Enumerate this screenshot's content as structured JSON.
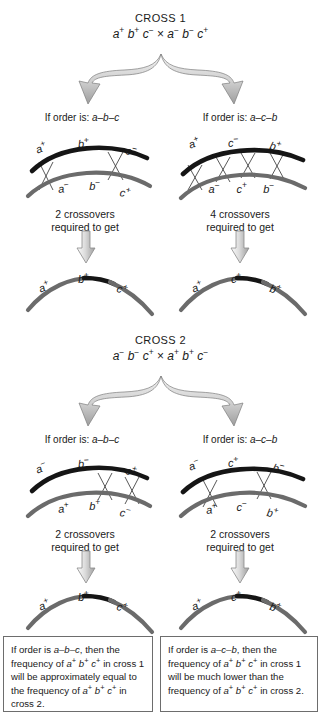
{
  "page": {
    "background": "#ffffff",
    "chromosome_top_color": "#151515",
    "chromosome_bottom_color": "#6b6b6b",
    "arrow_fill_light": "#e4e4e4",
    "arrow_fill_dark": "#9a9a9a",
    "box_border_color": "#6d6d6d",
    "crossover_line_color": "#3a3a3a"
  },
  "cross1": {
    "title": "CROSS 1",
    "genotype": {
      "parent1": [
        {
          "gene": "a",
          "sign": "+"
        },
        {
          "gene": "b",
          "sign": "+"
        },
        {
          "gene": "c",
          "sign": "−"
        }
      ],
      "operator": "×",
      "parent2": [
        {
          "gene": "a",
          "sign": "−"
        },
        {
          "gene": "b",
          "sign": "−"
        },
        {
          "gene": "c",
          "sign": "+"
        }
      ]
    },
    "branches": [
      {
        "order_prefix": "If order is: ",
        "order": "a–b–c",
        "top_chromosome": [
          {
            "gene": "a",
            "sign": "+"
          },
          {
            "gene": "b",
            "sign": "+"
          },
          {
            "gene": "c",
            "sign": "−"
          }
        ],
        "bottom_chromosome": [
          {
            "gene": "a",
            "sign": "−"
          },
          {
            "gene": "b",
            "sign": "−"
          },
          {
            "gene": "c",
            "sign": "+"
          }
        ],
        "crossover_count": 2,
        "crossover_text_line1": "2 crossovers",
        "crossover_text_line2": "required to get",
        "result_chromosome": [
          {
            "gene": "a",
            "sign": "+"
          },
          {
            "gene": "b",
            "sign": "+"
          },
          {
            "gene": "c",
            "sign": "+"
          }
        ]
      },
      {
        "order_prefix": "If order is: ",
        "order": "a–c–b",
        "top_chromosome": [
          {
            "gene": "a",
            "sign": "+"
          },
          {
            "gene": "c",
            "sign": "−"
          },
          {
            "gene": "b",
            "sign": "+"
          }
        ],
        "bottom_chromosome": [
          {
            "gene": "a",
            "sign": "−"
          },
          {
            "gene": "c",
            "sign": "+"
          },
          {
            "gene": "b",
            "sign": "−"
          }
        ],
        "crossover_count": 4,
        "crossover_text_line1": "4 crossovers",
        "crossover_text_line2": "required to get",
        "result_chromosome": [
          {
            "gene": "a",
            "sign": "+"
          },
          {
            "gene": "c",
            "sign": "+"
          },
          {
            "gene": "b",
            "sign": "+"
          }
        ]
      }
    ]
  },
  "cross2": {
    "title": "CROSS 2",
    "genotype": {
      "parent1": [
        {
          "gene": "a",
          "sign": "−"
        },
        {
          "gene": "b",
          "sign": "−"
        },
        {
          "gene": "c",
          "sign": "+"
        }
      ],
      "operator": "×",
      "parent2": [
        {
          "gene": "a",
          "sign": "+"
        },
        {
          "gene": "b",
          "sign": "+"
        },
        {
          "gene": "c",
          "sign": "−"
        }
      ]
    },
    "branches": [
      {
        "order_prefix": "If order is: ",
        "order": "a–b–c",
        "top_chromosome": [
          {
            "gene": "a",
            "sign": "−"
          },
          {
            "gene": "b",
            "sign": "−"
          },
          {
            "gene": "c",
            "sign": "+"
          }
        ],
        "bottom_chromosome": [
          {
            "gene": "a",
            "sign": "+"
          },
          {
            "gene": "b",
            "sign": "+"
          },
          {
            "gene": "c",
            "sign": "−"
          }
        ],
        "crossover_count": 2,
        "crossover_text_line1": "2 crossovers",
        "crossover_text_line2": "required to get",
        "result_chromosome": [
          {
            "gene": "a",
            "sign": "+"
          },
          {
            "gene": "b",
            "sign": "+"
          },
          {
            "gene": "c",
            "sign": "+"
          }
        ]
      },
      {
        "order_prefix": "If order is: ",
        "order": "a–c–b",
        "top_chromosome": [
          {
            "gene": "a",
            "sign": "−"
          },
          {
            "gene": "c",
            "sign": "+"
          },
          {
            "gene": "b",
            "sign": "−"
          }
        ],
        "bottom_chromosome": [
          {
            "gene": "a",
            "sign": "+"
          },
          {
            "gene": "c",
            "sign": "−"
          },
          {
            "gene": "b",
            "sign": "+"
          }
        ],
        "crossover_count": 2,
        "crossover_text_line1": "2 crossovers",
        "crossover_text_line2": "required to get",
        "result_chromosome": [
          {
            "gene": "a",
            "sign": "+"
          },
          {
            "gene": "c",
            "sign": "+"
          },
          {
            "gene": "b",
            "sign": "+"
          }
        ]
      }
    ]
  },
  "conclusions": [
    {
      "segments": [
        {
          "t": "If order is ",
          "style": "normal"
        },
        {
          "t": "a–b–c",
          "style": "italic"
        },
        {
          "t": ", then the frequency of ",
          "style": "normal"
        },
        {
          "t": "a",
          "style": "italic"
        },
        {
          "t": "+",
          "style": "sup"
        },
        {
          "t": " b",
          "style": "italic"
        },
        {
          "t": "+",
          "style": "sup"
        },
        {
          "t": " c",
          "style": "italic"
        },
        {
          "t": "+",
          "style": "sup"
        },
        {
          "t": " in cross 1 will be approximately equal to the frequency of ",
          "style": "normal"
        },
        {
          "t": "a",
          "style": "italic"
        },
        {
          "t": "+",
          "style": "sup"
        },
        {
          "t": " b",
          "style": "italic"
        },
        {
          "t": "+",
          "style": "sup"
        },
        {
          "t": " c",
          "style": "italic"
        },
        {
          "t": "+",
          "style": "sup"
        },
        {
          "t": " in cross 2.",
          "style": "normal"
        }
      ]
    },
    {
      "segments": [
        {
          "t": "If order is ",
          "style": "normal"
        },
        {
          "t": "a–c–b",
          "style": "italic"
        },
        {
          "t": ", then the frequency of ",
          "style": "normal"
        },
        {
          "t": "a",
          "style": "italic"
        },
        {
          "t": "+",
          "style": "sup"
        },
        {
          "t": " b",
          "style": "italic"
        },
        {
          "t": "+",
          "style": "sup"
        },
        {
          "t": " c",
          "style": "italic"
        },
        {
          "t": "+",
          "style": "sup"
        },
        {
          "t": " in cross 1 will be much lower than the frequency of ",
          "style": "normal"
        },
        {
          "t": "a",
          "style": "italic"
        },
        {
          "t": "+",
          "style": "sup"
        },
        {
          "t": " b",
          "style": "italic"
        },
        {
          "t": "+",
          "style": "sup"
        },
        {
          "t": " c",
          "style": "italic"
        },
        {
          "t": "+",
          "style": "sup"
        },
        {
          "t": " in cross 2.",
          "style": "normal"
        }
      ]
    }
  ]
}
